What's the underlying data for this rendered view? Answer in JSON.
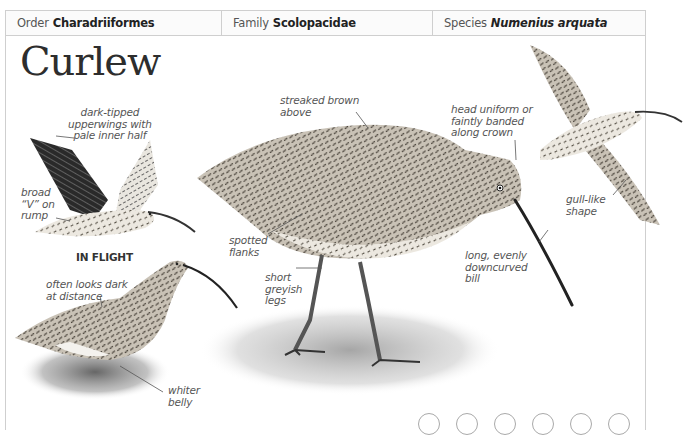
{
  "header": {
    "order": {
      "label": "Order",
      "value": "Charadriiformes"
    },
    "family": {
      "label": "Family",
      "value": "Scolopacidae"
    },
    "species": {
      "label": "Species",
      "value": "Numenius arquata"
    }
  },
  "title": "Curlew",
  "flight_caption": "IN FLIGHT",
  "annotations": {
    "dark_tipped": [
      "dark-tipped",
      "upperwings with",
      "pale inner half"
    ],
    "broad_v": [
      "broad",
      "“V” on",
      "rump"
    ],
    "streaked": [
      "streaked brown",
      "above"
    ],
    "head_uniform": [
      "head uniform or",
      "faintly banded",
      "along crown"
    ],
    "spotted_flanks": [
      "spotted",
      "flanks"
    ],
    "short_legs": [
      "short",
      "greyish",
      "legs"
    ],
    "long_bill": [
      "long, evenly",
      "downcurved",
      "bill"
    ],
    "gull_like": [
      "gull-like",
      "shape"
    ],
    "often_dark": [
      "often looks dark",
      "at distance"
    ],
    "whiter_belly": [
      "whiter",
      "belly"
    ]
  },
  "nav_dots_count": 6,
  "colors": {
    "frame": "#cfcfcf",
    "label": "#555555",
    "title": "#2d2d2d"
  }
}
